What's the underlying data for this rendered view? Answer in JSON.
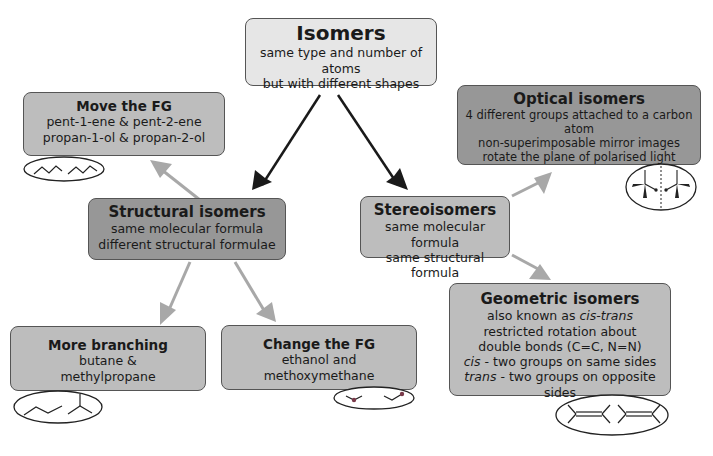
{
  "root": {
    "title": "Isomers",
    "lines": [
      "same type and number of atoms",
      "but with different shapes"
    ]
  },
  "structural": {
    "title": "Structural isomers",
    "lines": [
      "same molecular formula",
      "different structural formulae"
    ]
  },
  "stereo": {
    "title": "Stereoisomers",
    "lines": [
      "same molecular formula",
      "same structural formula"
    ]
  },
  "move_fg": {
    "title": "Move the FG",
    "lines": [
      "pent-1-ene & pent-2-ene",
      "propan-1-ol & propan-2-ol"
    ],
    "icon": "zigzag-chains-icon"
  },
  "branching": {
    "title": "More branching",
    "lines": [
      "butane &",
      "methylpropane"
    ],
    "icon": "butane-methylpropane-skeleton-icon"
  },
  "change_fg": {
    "title": "Change the FG",
    "lines": [
      "ethanol and",
      "methoxymethane"
    ],
    "icon": "ethanol-ether-skeleton-icon"
  },
  "optical": {
    "title": "Optical isomers",
    "lines": [
      "4 different groups attached to a carbon atom",
      "non-superimposable mirror images",
      "rotate the plane of polarised light"
    ],
    "icon": "mirror-image-molecules-icon"
  },
  "geometric": {
    "title": "Geometric isomers",
    "line1_prefix": "also known as ",
    "line1_italic": "cis-trans",
    "lines": [
      "restricted rotation about",
      "double bonds (C=C, N=N)"
    ],
    "cis_label": "cis",
    "cis_text": " - two groups on same sides",
    "trans_label": "trans",
    "trans_text": " - two groups on opposite sides",
    "icon": "cis-trans-alkenes-icon"
  },
  "colors": {
    "light_box": "#e6e6e6",
    "mid_box": "#bdbdbd",
    "dark_box": "#979797",
    "black_arrow": "#1a1a1a",
    "grey_arrow": "#a8a8a8"
  }
}
